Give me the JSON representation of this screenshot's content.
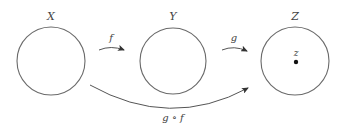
{
  "diagram": {
    "type": "function-composition",
    "sets": [
      {
        "id": "X",
        "label": "X",
        "cx": 51,
        "cy": 61,
        "r": 34
      },
      {
        "id": "Y",
        "label": "Y",
        "cx": 173,
        "cy": 61,
        "r": 33
      },
      {
        "id": "Z",
        "label": "Z",
        "cx": 295,
        "cy": 61,
        "r": 34
      }
    ],
    "arrows": [
      {
        "id": "f",
        "label": "f",
        "from": "X",
        "to": "Y"
      },
      {
        "id": "g",
        "label": "g",
        "from": "Y",
        "to": "Z"
      },
      {
        "id": "g_of_f",
        "label": "g ∘ f",
        "from": "X",
        "to": "Z"
      }
    ],
    "points": [
      {
        "id": "z",
        "label": "z",
        "in": "Z"
      }
    ],
    "colors": {
      "stroke": "#6a6a6a",
      "text": "#444444",
      "point": "#111111"
    }
  }
}
